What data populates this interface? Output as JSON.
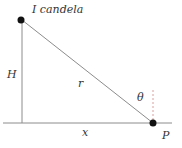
{
  "diagram": {
    "labels": {
      "source": "I candela",
      "height": "H",
      "distance": "r",
      "angle": "θ",
      "horizontal": "x",
      "point": "P"
    },
    "colors": {
      "line": "#8c8c8c",
      "dot": "#111111",
      "text": "#333333",
      "dashed": "#d8a0a0"
    }
  }
}
